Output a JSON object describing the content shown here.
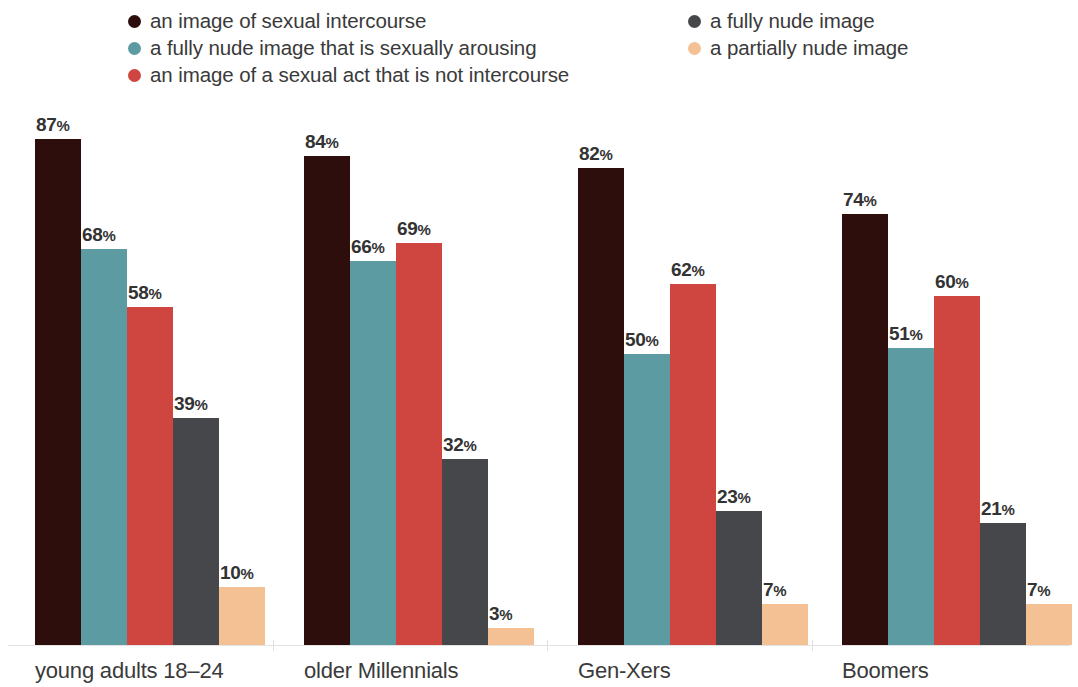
{
  "legend": {
    "columns": [
      {
        "items": [
          {
            "label": "an image of sexual intercourse",
            "color": "#2e0d0d",
            "icon": "legend-dot-icon"
          },
          {
            "label": "a fully nude image that is sexually arousing",
            "color": "#5d9ba3",
            "icon": "legend-dot-icon"
          },
          {
            "label": "an image of a sexual act that is not intercourse",
            "color": "#cf4640",
            "icon": "legend-dot-icon"
          }
        ]
      },
      {
        "items": [
          {
            "label": "a fully nude image",
            "color": "#46474a",
            "icon": "legend-dot-icon"
          },
          {
            "label": "a partially nude image",
            "color": "#f3c193",
            "icon": "legend-dot-icon"
          }
        ]
      }
    ]
  },
  "chart_data": {
    "type": "bar",
    "title": "",
    "subtitle": "",
    "xlabel": "",
    "ylabel": "",
    "ylim": [
      0,
      100
    ],
    "grid": false,
    "legend_position": "top",
    "value_suffix": "%",
    "categories": [
      "young adults 18–24",
      "older Millennials",
      "Gen-Xers",
      "Boomers"
    ],
    "series": [
      {
        "name": "an image of sexual intercourse",
        "color": "#2e0d0d",
        "values": [
          87,
          84,
          82,
          74
        ]
      },
      {
        "name": "a fully nude image that is sexually arousing",
        "color": "#5d9ba3",
        "values": [
          68,
          66,
          50,
          51
        ]
      },
      {
        "name": "an image of a sexual act that is not intercourse",
        "color": "#cf4640",
        "values": [
          58,
          69,
          62,
          60
        ]
      },
      {
        "name": "a fully nude image",
        "color": "#46474a",
        "values": [
          39,
          32,
          23,
          21
        ]
      },
      {
        "name": "a partially nude image",
        "color": "#f3c193",
        "values": [
          10,
          3,
          7,
          7
        ]
      }
    ],
    "labels": [
      [
        "87%",
        "68%",
        "58%",
        "39%",
        "10%"
      ],
      [
        "84%",
        "66%",
        "69%",
        "32%",
        "3%"
      ],
      [
        "82%",
        "50%",
        "62%",
        "23%",
        "7%"
      ],
      [
        "74%",
        "51%",
        "60%",
        "21%",
        "7%"
      ]
    ]
  }
}
